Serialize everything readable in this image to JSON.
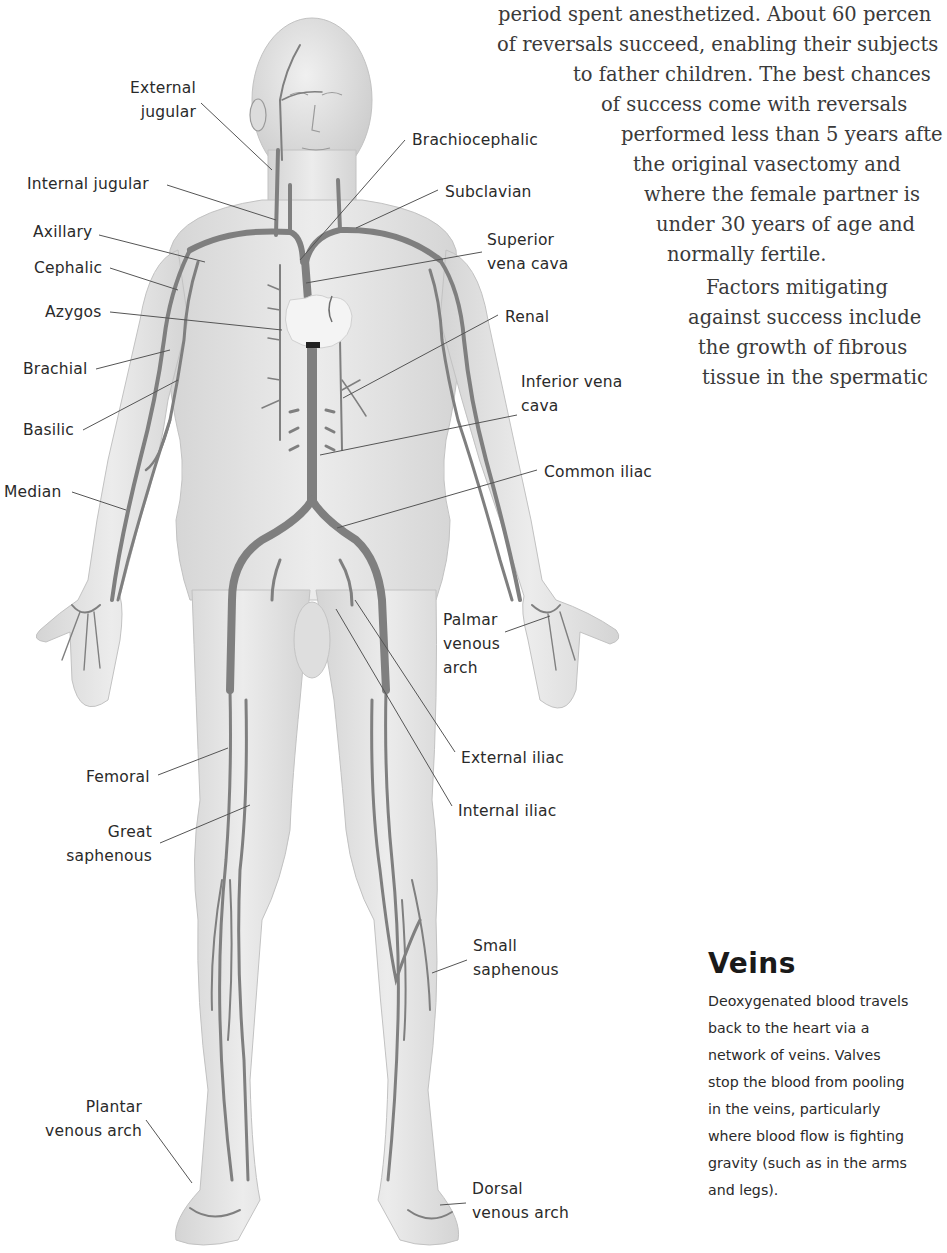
{
  "article": {
    "cutoff_top_line": "·",
    "lines": [
      {
        "text": "period spent anesthetized. About 60 percen",
        "x": 498,
        "y": 10
      },
      {
        "text": "of reversals succeed, enabling their subjects",
        "x": 497,
        "y": 40
      },
      {
        "text": "to father children. The best chances",
        "x": 573,
        "y": 70
      },
      {
        "text": "of success come with reversals",
        "x": 601,
        "y": 100
      },
      {
        "text": "performed less than 5 years afte",
        "x": 621,
        "y": 130
      },
      {
        "text": "the original vasectomy and",
        "x": 633,
        "y": 160
      },
      {
        "text": "where the female partner is",
        "x": 644,
        "y": 190
      },
      {
        "text": "under 30 years of age and",
        "x": 656,
        "y": 220
      },
      {
        "text": "normally fertile.",
        "x": 667,
        "y": 250
      },
      {
        "text": "Factors mitigating",
        "x": 706,
        "y": 283
      },
      {
        "text": "against success include",
        "x": 688,
        "y": 313
      },
      {
        "text": "the growth of fibrous",
        "x": 698,
        "y": 343
      },
      {
        "text": "tissue in the spermatic",
        "x": 702,
        "y": 373
      }
    ]
  },
  "sidebar": {
    "title": "Veins",
    "lines": [
      "Deoxygenated blood travels",
      "back to the heart via a",
      "network of veins. Valves",
      "stop the blood from pooling",
      "in the veins, particularly",
      "where blood flow is fighting",
      "gravity (such as in the arms",
      "and legs)."
    ]
  },
  "figure": {
    "colors": {
      "skin": "#e6e6e6",
      "skin_shadow": "#cfcfcf",
      "vein": "#8a8a8a",
      "vein_dark": "#6e6e6e",
      "leader": "#555555",
      "heart": "#f4f4f4"
    },
    "labels": {
      "external_jugular": {
        "lines": [
          "External",
          "jugular"
        ]
      },
      "internal_jugular": {
        "lines": [
          "Internal jugular"
        ]
      },
      "axillary": {
        "lines": [
          "Axillary"
        ]
      },
      "cephalic": {
        "lines": [
          "Cephalic"
        ]
      },
      "azygos": {
        "lines": [
          "Azygos"
        ]
      },
      "brachial": {
        "lines": [
          "Brachial"
        ]
      },
      "basilic": {
        "lines": [
          "Basilic"
        ]
      },
      "median": {
        "lines": [
          "Median"
        ]
      },
      "femoral": {
        "lines": [
          "Femoral"
        ]
      },
      "great_saphenous": {
        "lines": [
          "Great",
          "saphenous"
        ]
      },
      "plantar_venous_arch": {
        "lines": [
          "Plantar",
          "venous arch"
        ]
      },
      "brachiocephalic": {
        "lines": [
          "Brachiocephalic"
        ]
      },
      "subclavian": {
        "lines": [
          "Subclavian"
        ]
      },
      "superior_vena_cava": {
        "lines": [
          "Superior",
          "vena cava"
        ]
      },
      "renal": {
        "lines": [
          "Renal"
        ]
      },
      "inferior_vena_cava": {
        "lines": [
          "Inferior vena",
          "cava"
        ]
      },
      "common_iliac": {
        "lines": [
          "Common iliac"
        ]
      },
      "palmar_venous_arch": {
        "lines": [
          "Palmar",
          "venous",
          "arch"
        ]
      },
      "external_iliac": {
        "lines": [
          "External iliac"
        ]
      },
      "internal_iliac": {
        "lines": [
          "Internal iliac"
        ]
      },
      "small_saphenous": {
        "lines": [
          "Small",
          "saphenous"
        ]
      },
      "dorsal_venous_arch": {
        "lines": [
          "Dorsal",
          "venous arch"
        ]
      }
    }
  }
}
